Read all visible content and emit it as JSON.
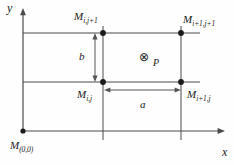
{
  "figure": {
    "background_color": "#fefefe",
    "line_color": "#4a4a4a",
    "text_color": "#1a1a1a"
  },
  "axes": {
    "x_label": "x",
    "y_label": "y"
  },
  "nodes": {
    "origin": "M",
    "origin_sub": "(0,0)",
    "bottom_left": "M",
    "bottom_left_sub": "i,j",
    "bottom_right": "M",
    "bottom_right_sub": "i+1,j",
    "top_left": "M",
    "top_left_sub": "i,j+1",
    "top_right": "M",
    "top_right_sub": "i+1,j+1"
  },
  "dimensions": {
    "horizontal": "a",
    "vertical": "b"
  },
  "point": {
    "symbol": "⊗",
    "label": "P"
  }
}
